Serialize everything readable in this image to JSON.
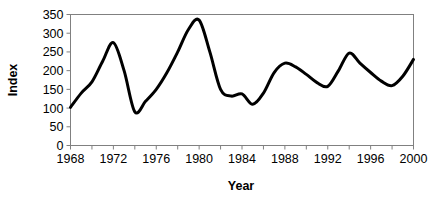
{
  "chart_data": {
    "type": "line",
    "title": "",
    "subtitle": "",
    "xlabel": "Year",
    "ylabel": "Index",
    "xlim": [
      1968,
      2000
    ],
    "ylim": [
      0,
      350
    ],
    "grid": false,
    "legend": false,
    "legend_position": "none",
    "y_ticks": [
      0,
      50,
      100,
      150,
      200,
      250,
      300,
      350
    ],
    "y_tick_labels": [
      "0",
      "50",
      "100",
      "150",
      "200",
      "250",
      "300",
      "350"
    ],
    "x_ticks": [
      1968,
      1972,
      1976,
      1980,
      1984,
      1988,
      1992,
      1996,
      2000
    ],
    "x_tick_labels": [
      "1968",
      "1972",
      "1976",
      "1980",
      "1984",
      "1988",
      "1992",
      "1996",
      "2000"
    ],
    "x_minor_ticks": [
      1970,
      1974,
      1978,
      1982,
      1986,
      1990,
      1994,
      1998
    ],
    "x": [
      1968,
      1969,
      1970,
      1971,
      1972,
      1973,
      1974,
      1975,
      1976,
      1977,
      1978,
      1979,
      1980,
      1981,
      1982,
      1983,
      1984,
      1985,
      1986,
      1987,
      1988,
      1989,
      1990,
      1991,
      1992,
      1993,
      1994,
      1995,
      1996,
      1997,
      1998,
      1999,
      2000
    ],
    "values": [
      102,
      140,
      170,
      225,
      275,
      200,
      90,
      118,
      150,
      195,
      250,
      310,
      335,
      250,
      150,
      132,
      138,
      110,
      140,
      195,
      220,
      210,
      190,
      168,
      158,
      200,
      247,
      220,
      195,
      172,
      160,
      185,
      230
    ],
    "series": [
      {
        "name": "Index",
        "color": "#000000",
        "values": [
          102,
          140,
          170,
          225,
          275,
          200,
          90,
          118,
          150,
          195,
          250,
          310,
          335,
          250,
          150,
          132,
          138,
          110,
          140,
          195,
          220,
          210,
          190,
          168,
          158,
          200,
          247,
          220,
          195,
          172,
          160,
          185,
          230
        ]
      }
    ],
    "annotations": []
  },
  "colors": {
    "line": "#000000",
    "frame": "#808080",
    "background": "#ffffff",
    "text": "#000000"
  }
}
